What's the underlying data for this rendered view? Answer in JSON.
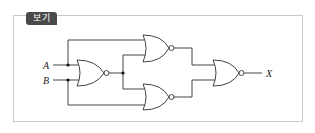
{
  "panel": {
    "tab_label": "보기"
  },
  "circuit": {
    "inputs": [
      "A",
      "B"
    ],
    "output": "X",
    "gates": [
      {
        "id": "G1",
        "type": "NOR",
        "inputs": [
          "A",
          "B"
        ]
      },
      {
        "id": "G2",
        "type": "NOR",
        "inputs": [
          "A",
          "G1"
        ]
      },
      {
        "id": "G3",
        "type": "NOR",
        "inputs": [
          "G1",
          "B"
        ]
      },
      {
        "id": "G4",
        "type": "NOR",
        "inputs": [
          "G2",
          "G3"
        ],
        "output": "X"
      }
    ],
    "colors": {
      "line": "#444444",
      "tab_bg": "#4a4a4a",
      "frame": "#c9c9c9"
    }
  }
}
